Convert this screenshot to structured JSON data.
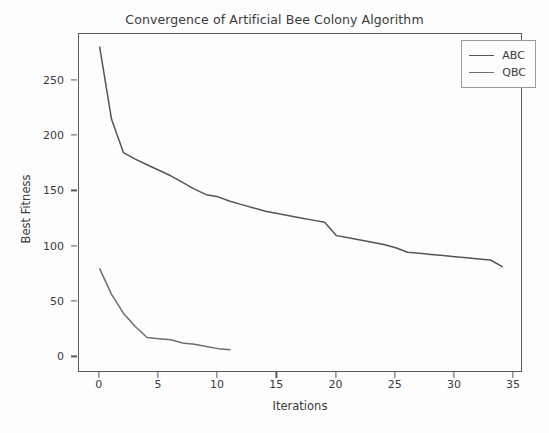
{
  "chart_data": {
    "type": "line",
    "title": "Convergence of Artificial Bee Colony Algorithm",
    "xlabel": "Iterations",
    "ylabel": "Best Fitness",
    "xlim": [
      -1.75,
      35.75
    ],
    "ylim": [
      -14,
      292
    ],
    "xticks": [
      0,
      5,
      10,
      15,
      20,
      25,
      30,
      35
    ],
    "yticks": [
      0,
      50,
      100,
      150,
      200,
      250
    ],
    "grid": false,
    "legend_position": "upper right",
    "series": [
      {
        "name": "ABC",
        "color": "#555555",
        "x": [
          0,
          1,
          2,
          3,
          4,
          5,
          6,
          7,
          8,
          9,
          10,
          11,
          12,
          13,
          14,
          15,
          16,
          17,
          18,
          19,
          20,
          21,
          22,
          23,
          24,
          25,
          26,
          27,
          28,
          29,
          30,
          31,
          32,
          33,
          34
        ],
        "y": [
          280,
          215,
          185,
          179,
          174,
          169,
          164,
          158,
          152,
          147,
          145,
          141,
          138,
          135,
          132,
          130,
          128,
          126,
          124,
          122,
          110,
          108,
          106,
          104,
          102,
          99,
          95,
          94,
          93,
          92,
          91,
          90,
          89,
          88,
          82
        ]
      },
      {
        "name": "QBC",
        "color": "#6e6e6e",
        "x": [
          0,
          1,
          2,
          3,
          4,
          5,
          6,
          7,
          8,
          9,
          10,
          11
        ],
        "y": [
          80,
          57,
          40,
          28,
          18,
          17,
          16,
          13,
          12,
          10,
          8,
          7
        ]
      }
    ]
  },
  "legend": {
    "entries": [
      {
        "label": "ABC"
      },
      {
        "label": "QBC"
      }
    ]
  }
}
